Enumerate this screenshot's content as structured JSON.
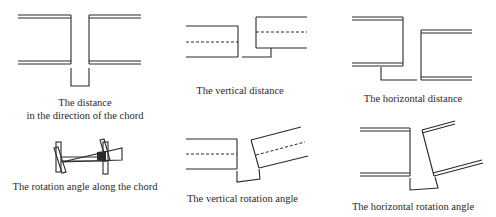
{
  "figure": {
    "panels": [
      {
        "id": "chord-distance",
        "caption_lines": [
          "The distance",
          "in the direction of the chord"
        ]
      },
      {
        "id": "vertical-distance",
        "caption_lines": [
          "The vertical distance"
        ]
      },
      {
        "id": "horizontal-distance",
        "caption_lines": [
          "The horizontal distance"
        ]
      },
      {
        "id": "rotation-along-chord",
        "caption_lines": [
          "The rotation angle along the chord"
        ]
      },
      {
        "id": "vertical-rotation",
        "caption_lines": [
          "The vertical rotation angle"
        ]
      },
      {
        "id": "horizontal-rotation",
        "caption_lines": [
          "The horizontal rotation angle"
        ]
      }
    ],
    "line_color": "#2a2a2a",
    "background": "#ffffff"
  }
}
